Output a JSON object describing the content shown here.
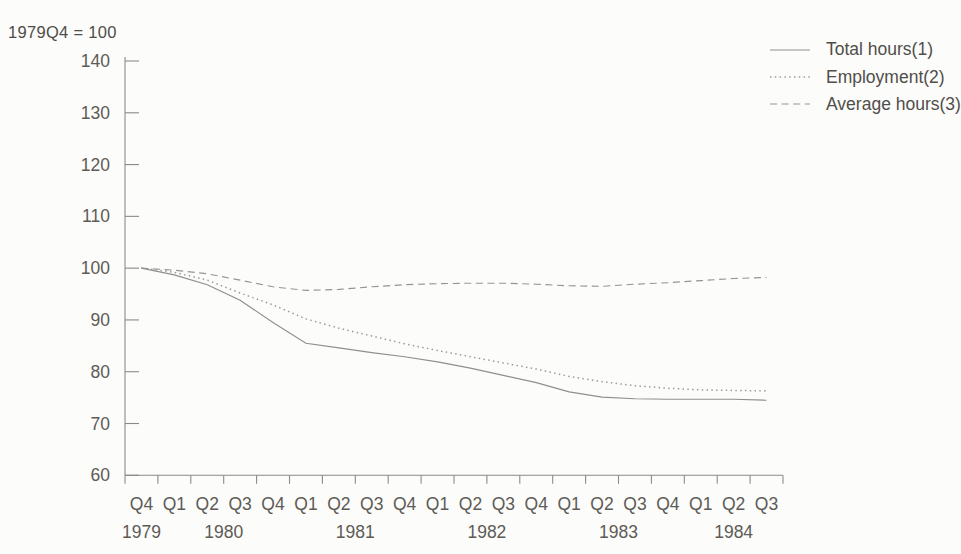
{
  "chart_data": {
    "type": "line",
    "title": "",
    "unit_note": "1979Q4 = 100",
    "xlabel": "",
    "ylabel": "",
    "ylim": [
      60,
      140
    ],
    "yticks": [
      60,
      70,
      80,
      90,
      100,
      110,
      120,
      130,
      140
    ],
    "grid": false,
    "legend_position": "top-right",
    "x_categories": [
      "Q4",
      "Q1",
      "Q2",
      "Q3",
      "Q4",
      "Q1",
      "Q2",
      "Q3",
      "Q4",
      "Q1",
      "Q2",
      "Q3",
      "Q4",
      "Q1",
      "Q2",
      "Q3",
      "Q4",
      "Q1",
      "Q2",
      "Q3"
    ],
    "year_groups": [
      {
        "label": "1979",
        "from": 0,
        "to": 0
      },
      {
        "label": "1980",
        "from": 1,
        "to": 4
      },
      {
        "label": "1981",
        "from": 5,
        "to": 8
      },
      {
        "label": "1982",
        "from": 9,
        "to": 12
      },
      {
        "label": "1983",
        "from": 13,
        "to": 16
      },
      {
        "label": "1984",
        "from": 17,
        "to": 19
      }
    ],
    "series": [
      {
        "name": "Total hours(1)",
        "style": "solid",
        "values": [
          100,
          98.7,
          96.8,
          93.8,
          89.5,
          85.5,
          84.6,
          83.7,
          82.9,
          81.9,
          80.7,
          79.3,
          77.9,
          76.1,
          75.1,
          74.8,
          74.7,
          74.7,
          74.7,
          74.5
        ]
      },
      {
        "name": "Employment(2)",
        "style": "dotted",
        "values": [
          100,
          99.2,
          97.7,
          95.2,
          92.9,
          90.2,
          88.4,
          86.9,
          85.4,
          84.1,
          82.9,
          81.7,
          80.5,
          79.1,
          78.1,
          77.3,
          76.8,
          76.5,
          76.4,
          76.3
        ]
      },
      {
        "name": "Average hours(3)",
        "style": "dashed",
        "values": [
          100,
          99.6,
          98.9,
          97.7,
          96.4,
          95.7,
          95.9,
          96.4,
          96.8,
          97.0,
          97.1,
          97.1,
          96.9,
          96.6,
          96.5,
          96.9,
          97.2,
          97.6,
          98.0,
          98.2
        ]
      }
    ],
    "colors": {
      "line_ink": "#8f8f8c",
      "text_ink": "#5d5b56",
      "background": "#fcfcfa"
    }
  }
}
